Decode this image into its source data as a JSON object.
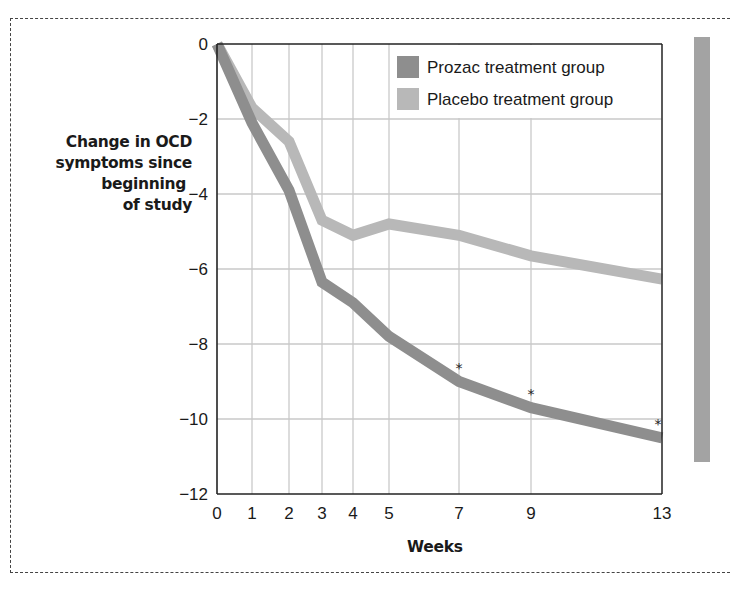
{
  "chart_data": {
    "type": "line",
    "title": "",
    "xlabel": "Weeks",
    "ylabel": "Change in OCD symptoms since beginning of study",
    "ylabel_lines": [
      "Change in OCD",
      "symptoms since",
      "beginning",
      "of study"
    ],
    "x": [
      0,
      1,
      2,
      3,
      4,
      5,
      7,
      9,
      13
    ],
    "x_ticks": [
      "0",
      "1",
      "2",
      "3",
      "4",
      "5",
      "7",
      "9",
      "13"
    ],
    "y_ticks": [
      "0",
      "−2",
      "−4",
      "−6",
      "−8",
      "−10",
      "−12"
    ],
    "y_tick_values": [
      0,
      -2,
      -4,
      -6,
      -8,
      -10,
      -12
    ],
    "ylim": [
      -12,
      0
    ],
    "grid": true,
    "legend_position": "upper right (inside plot)",
    "series": [
      {
        "name": "Prozac treatment group",
        "color": "#8e8e8e",
        "values": [
          0,
          -2.1,
          -3.9,
          -6.35,
          -6.9,
          -7.8,
          -9.0,
          -9.7,
          -10.5
        ]
      },
      {
        "name": "Placebo treatment group",
        "color": "#b8b8b8",
        "values": [
          0,
          -1.7,
          -2.6,
          -4.7,
          -5.1,
          -4.8,
          -5.1,
          -5.65,
          -6.27
        ]
      }
    ],
    "annotations": [
      {
        "text": "*",
        "x": 7,
        "note": "significance marker above Prozac line"
      },
      {
        "text": "*",
        "x": 9,
        "note": "significance marker above Prozac line"
      },
      {
        "text": "*",
        "x": 13,
        "note": "significance marker above Prozac line"
      }
    ]
  },
  "colors": {
    "prozac": "#8e8e8e",
    "placebo": "#b8b8b8",
    "grid": "#c9c9c9",
    "axis": "#222222",
    "side_bar": "#a3a3a3"
  },
  "legend": {
    "items": [
      {
        "label": "Prozac treatment group"
      },
      {
        "label": "Placebo treatment group"
      }
    ]
  },
  "annotation_symbol": "*"
}
